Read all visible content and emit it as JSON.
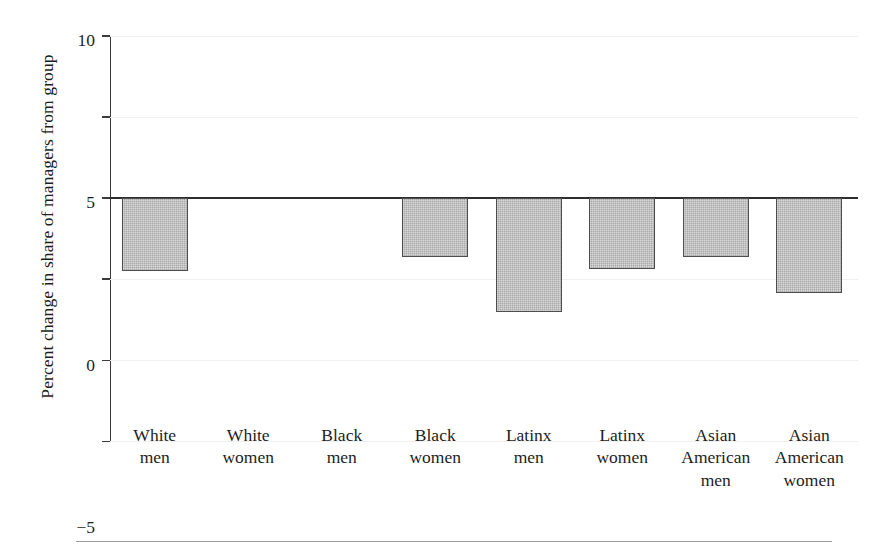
{
  "chart_data": {
    "type": "bar",
    "title": "",
    "xlabel": "",
    "ylabel": "Percent change in share of managers from group",
    "categories": [
      "White men",
      "White women",
      "Black men",
      "Black women",
      "Latinx men",
      "Latinx women",
      "Asian American men",
      "Asian American women"
    ],
    "category_lines": [
      [
        "White",
        "men"
      ],
      [
        "White",
        "women"
      ],
      [
        "Black",
        "men"
      ],
      [
        "Black",
        "women"
      ],
      [
        "Latinx",
        "men"
      ],
      [
        "Latinx",
        "women"
      ],
      [
        "Asian",
        "American",
        "men"
      ],
      [
        "Asian",
        "American",
        "women"
      ]
    ],
    "values": [
      -4.5,
      0,
      0,
      -3.65,
      -7.0,
      -4.35,
      -3.65,
      -5.85
    ],
    "ylim": [
      -15,
      10
    ],
    "yticks": [
      10,
      5,
      0,
      -5,
      -10,
      -15
    ],
    "ytick_labels": [
      "10",
      "5",
      "0",
      "−5",
      "−10",
      "−15"
    ],
    "grid": true,
    "grid_axis": "y",
    "legend": "none",
    "bar_color": "#a9a9a9",
    "bar_edge_color": "#4e4e4e",
    "axis_color": "#3b3b3b",
    "grid_color": "#f0f0f0"
  }
}
